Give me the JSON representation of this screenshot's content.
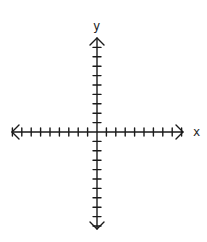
{
  "diagram": {
    "type": "coordinate-plane",
    "x_axis": {
      "label": "x",
      "ticks_left": 9,
      "ticks_right": 9,
      "arrows": "both"
    },
    "y_axis": {
      "label": "y",
      "ticks_up": 9,
      "ticks_down": 10,
      "arrows": "both"
    },
    "color": "#1a1a1a"
  }
}
